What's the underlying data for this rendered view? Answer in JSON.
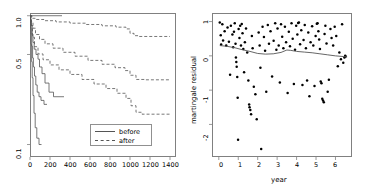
{
  "figure": {
    "background": "#ffffff",
    "frame_color": "#808080",
    "line_color": "#555555",
    "point_color": "#000000"
  },
  "chart_data": [
    {
      "type": "line",
      "panel": "left",
      "title": "",
      "xlabel": "",
      "ylabel": "",
      "xlim": [
        0,
        1460
      ],
      "ylim": [
        0.08,
        1.05
      ],
      "yscale": "log",
      "grid": false,
      "xticks": [
        0,
        200,
        400,
        600,
        800,
        1000,
        1200,
        1400
      ],
      "xticklabels": [
        "0",
        "200",
        "400",
        "600",
        "800",
        "1000",
        "1200",
        "1400"
      ],
      "yticks": [
        1.0,
        0.5,
        0.1
      ],
      "yticklabels": [
        "1.0",
        "0.5",
        "0.1"
      ],
      "legend": {
        "position": "bottom-right",
        "entries": [
          {
            "label": "before",
            "style": "solid"
          },
          {
            "label": "after",
            "style": "dashed"
          }
        ]
      },
      "series": [
        {
          "name": "before-1",
          "style": "solid",
          "shape": "step",
          "points": [
            [
              0,
              1.0
            ],
            [
              10,
              1.0
            ],
            [
              320,
              1.0
            ]
          ]
        },
        {
          "name": "before-2",
          "style": "solid",
          "shape": "step",
          "points": [
            [
              0,
              1.0
            ],
            [
              8,
              0.93
            ],
            [
              15,
              0.84
            ],
            [
              22,
              0.72
            ],
            [
              30,
              0.62
            ],
            [
              42,
              0.55
            ],
            [
              60,
              0.5
            ],
            [
              80,
              0.46
            ],
            [
              95,
              0.4
            ],
            [
              120,
              0.355
            ],
            [
              150,
              0.3
            ],
            [
              190,
              0.255
            ],
            [
              235,
              0.235
            ],
            [
              340,
              0.235
            ]
          ]
        },
        {
          "name": "before-3",
          "style": "solid",
          "shape": "step",
          "points": [
            [
              0,
              1.0
            ],
            [
              6,
              0.88
            ],
            [
              12,
              0.72
            ],
            [
              18,
              0.58
            ],
            [
              26,
              0.47
            ],
            [
              34,
              0.4
            ],
            [
              45,
              0.34
            ],
            [
              58,
              0.29
            ],
            [
              72,
              0.255
            ],
            [
              90,
              0.235
            ],
            [
              110,
              0.22
            ],
            [
              140,
              0.205
            ],
            [
              170,
              0.205
            ]
          ]
        },
        {
          "name": "before-4",
          "style": "solid",
          "shape": "step",
          "points": [
            [
              0,
              1.0
            ],
            [
              5,
              0.8
            ],
            [
              10,
              0.6
            ],
            [
              16,
              0.44
            ],
            [
              22,
              0.33
            ],
            [
              30,
              0.24
            ],
            [
              40,
              0.175
            ],
            [
              52,
              0.135
            ],
            [
              68,
              0.112
            ],
            [
              90,
              0.1
            ],
            [
              115,
              0.1
            ]
          ]
        },
        {
          "name": "after-1",
          "style": "dashed",
          "shape": "step",
          "points": [
            [
              0,
              1.0
            ],
            [
              20,
              0.955
            ],
            [
              60,
              0.935
            ],
            [
              140,
              0.915
            ],
            [
              260,
              0.895
            ],
            [
              400,
              0.875
            ],
            [
              560,
              0.855
            ],
            [
              720,
              0.835
            ],
            [
              860,
              0.815
            ],
            [
              960,
              0.79
            ],
            [
              1000,
              0.73
            ],
            [
              1040,
              0.7
            ],
            [
              1080,
              0.69
            ],
            [
              1200,
              0.69
            ],
            [
              1400,
              0.69
            ]
          ]
        },
        {
          "name": "after-2",
          "style": "dashed",
          "shape": "step",
          "points": [
            [
              0,
              1.0
            ],
            [
              12,
              0.9
            ],
            [
              30,
              0.8
            ],
            [
              55,
              0.715
            ],
            [
              95,
              0.655
            ],
            [
              150,
              0.605
            ],
            [
              230,
              0.56
            ],
            [
              330,
              0.52
            ],
            [
              450,
              0.485
            ],
            [
              580,
              0.45
            ],
            [
              720,
              0.42
            ],
            [
              850,
              0.395
            ],
            [
              950,
              0.375
            ],
            [
              1000,
              0.345
            ],
            [
              1060,
              0.32
            ],
            [
              1150,
              0.318
            ],
            [
              1400,
              0.318
            ]
          ]
        },
        {
          "name": "after-3",
          "style": "dashed",
          "shape": "step",
          "points": [
            [
              0,
              1.0
            ],
            [
              10,
              0.84
            ],
            [
              25,
              0.68
            ],
            [
              45,
              0.575
            ],
            [
              80,
              0.505
            ],
            [
              130,
              0.455
            ],
            [
              200,
              0.415
            ],
            [
              290,
              0.38
            ],
            [
              400,
              0.35
            ],
            [
              520,
              0.32
            ],
            [
              640,
              0.295
            ],
            [
              760,
              0.272
            ],
            [
              870,
              0.25
            ],
            [
              960,
              0.228
            ],
            [
              1010,
              0.2
            ],
            [
              1060,
              0.178
            ],
            [
              1120,
              0.172
            ],
            [
              1300,
              0.172
            ],
            [
              1400,
              0.172
            ]
          ]
        }
      ]
    },
    {
      "type": "scatter",
      "panel": "right",
      "title": "",
      "xlabel": "year",
      "ylabel": "martingale residual",
      "xlim": [
        -0.35,
        6.85
      ],
      "ylim": [
        -2.95,
        1.25
      ],
      "grid": false,
      "xticks": [
        0,
        1,
        2,
        3,
        4,
        5,
        6
      ],
      "xticklabels": [
        "0",
        "1",
        "2",
        "3",
        "4",
        "5",
        "6"
      ],
      "yticks": [
        1,
        0,
        -1,
        -2
      ],
      "yticklabels": [
        "1",
        "0",
        "-1",
        "-2"
      ],
      "points": [
        [
          0.05,
          0.97
        ],
        [
          0.1,
          0.6
        ],
        [
          0.12,
          0.33
        ],
        [
          0.18,
          0.92
        ],
        [
          0.22,
          0.45
        ],
        [
          0.3,
          0.72
        ],
        [
          0.38,
          0.3
        ],
        [
          0.45,
          0.83
        ],
        [
          0.52,
          0.41
        ],
        [
          0.58,
          -0.55
        ],
        [
          0.62,
          0.88
        ],
        [
          0.7,
          0.62
        ],
        [
          0.74,
          0.25
        ],
        [
          0.78,
          0.7
        ],
        [
          0.82,
          0.95
        ],
        [
          0.86,
          0.35
        ],
        [
          0.88,
          -0.05
        ],
        [
          0.9,
          -0.18
        ],
        [
          0.92,
          -0.32
        ],
        [
          0.95,
          -0.62
        ],
        [
          0.97,
          -1.22
        ],
        [
          0.99,
          -2.45
        ],
        [
          1.02,
          0.78
        ],
        [
          1.06,
          0.52
        ],
        [
          1.1,
          0.88
        ],
        [
          1.14,
          0.3
        ],
        [
          1.18,
          0.93
        ],
        [
          1.22,
          0.66
        ],
        [
          1.26,
          0.2
        ],
        [
          1.3,
          -0.48
        ],
        [
          1.34,
          0.4
        ],
        [
          1.4,
          0.8
        ],
        [
          1.46,
          0.1
        ],
        [
          1.52,
          -0.72
        ],
        [
          1.56,
          -1.42
        ],
        [
          1.58,
          -1.5
        ],
        [
          1.62,
          -1.58
        ],
        [
          1.66,
          -1.7
        ],
        [
          1.7,
          0.58
        ],
        [
          1.74,
          0.22
        ],
        [
          1.8,
          -0.9
        ],
        [
          1.88,
          -1.12
        ],
        [
          1.95,
          -1.85
        ],
        [
          2.05,
          0.68
        ],
        [
          2.1,
          0.3
        ],
        [
          2.14,
          -0.35
        ],
        [
          2.18,
          -2.72
        ],
        [
          2.25,
          0.85
        ],
        [
          2.32,
          0.55
        ],
        [
          2.38,
          0.15
        ],
        [
          2.44,
          -1.05
        ],
        [
          2.52,
          0.9
        ],
        [
          2.58,
          0.35
        ],
        [
          2.66,
          0.72
        ],
        [
          2.74,
          -0.6
        ],
        [
          2.82,
          0.44
        ],
        [
          2.9,
          0.95
        ],
        [
          2.96,
          0.18
        ],
        [
          3.02,
          0.8
        ],
        [
          3.08,
          0.3
        ],
        [
          3.14,
          -0.78
        ],
        [
          3.2,
          0.92
        ],
        [
          3.26,
          0.56
        ],
        [
          3.32,
          0.22
        ],
        [
          3.4,
          0.85
        ],
        [
          3.46,
          0.4
        ],
        [
          3.54,
          -1.08
        ],
        [
          3.6,
          0.7
        ],
        [
          3.66,
          0.28
        ],
        [
          3.74,
          0.95
        ],
        [
          3.8,
          0.5
        ],
        [
          3.86,
          -0.82
        ],
        [
          3.92,
          0.18
        ],
        [
          3.98,
          0.88
        ],
        [
          4.04,
          0.62
        ],
        [
          4.08,
          0.96
        ],
        [
          4.12,
          0.97
        ],
        [
          4.18,
          0.34
        ],
        [
          4.24,
          0.75
        ],
        [
          4.3,
          -0.85
        ],
        [
          4.36,
          0.46
        ],
        [
          4.42,
          0.9
        ],
        [
          4.48,
          0.22
        ],
        [
          4.54,
          -0.72
        ],
        [
          4.6,
          0.68
        ],
        [
          4.66,
          -1.18
        ],
        [
          4.72,
          0.4
        ],
        [
          4.8,
          0.86
        ],
        [
          4.86,
          0.3
        ],
        [
          4.92,
          -0.88
        ],
        [
          4.98,
          0.58
        ],
        [
          5.04,
          0.94
        ],
        [
          5.08,
          0.95
        ],
        [
          5.12,
          0.72
        ],
        [
          5.16,
          0.48
        ],
        [
          5.2,
          0.2
        ],
        [
          5.24,
          -0.75
        ],
        [
          5.28,
          -0.8
        ],
        [
          5.32,
          -1.25
        ],
        [
          5.36,
          -1.3
        ],
        [
          5.4,
          -1.35
        ],
        [
          5.44,
          0.64
        ],
        [
          5.48,
          0.88
        ],
        [
          5.54,
          0.36
        ],
        [
          5.6,
          -1.05
        ],
        [
          5.66,
          -0.7
        ],
        [
          5.74,
          0.78
        ],
        [
          5.8,
          0.52
        ],
        [
          5.88,
          0.3
        ],
        [
          5.96,
          0.85
        ],
        [
          6.04,
          0.58
        ],
        [
          6.12,
          -0.3
        ],
        [
          6.2,
          0.1
        ],
        [
          6.28,
          -0.1
        ],
        [
          6.34,
          0.92
        ],
        [
          6.4,
          -0.2
        ],
        [
          6.46,
          -0.05
        ],
        [
          6.5,
          0.0
        ],
        [
          6.52,
          -0.02
        ]
      ],
      "smoother": {
        "name": "lowess",
        "style": "solid",
        "points": [
          [
            0.05,
            0.3
          ],
          [
            0.4,
            0.28
          ],
          [
            0.8,
            0.24
          ],
          [
            1.2,
            0.18
          ],
          [
            1.6,
            0.13
          ],
          [
            2.0,
            0.07
          ],
          [
            2.4,
            0.05
          ],
          [
            2.8,
            0.06
          ],
          [
            3.2,
            0.1
          ],
          [
            3.5,
            0.17
          ],
          [
            3.7,
            0.16
          ],
          [
            4.0,
            0.13
          ],
          [
            4.4,
            0.11
          ],
          [
            4.8,
            0.09
          ],
          [
            5.2,
            0.06
          ],
          [
            5.6,
            0.03
          ],
          [
            6.0,
            0.0
          ],
          [
            6.4,
            -0.02
          ],
          [
            6.6,
            -0.03
          ]
        ]
      }
    }
  ]
}
